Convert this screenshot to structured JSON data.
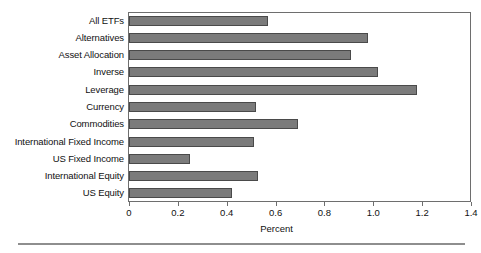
{
  "chart_data": {
    "type": "bar",
    "orientation": "horizontal",
    "title": "",
    "xlabel": "Percent",
    "ylabel": "",
    "xlim": [
      0,
      1.4
    ],
    "xticks": [
      "0",
      "0.2",
      "0.4",
      "0.6",
      "0.8",
      "1.0",
      "1.2",
      "1.4"
    ],
    "xtick_values": [
      0,
      0.2,
      0.4,
      0.6,
      0.8,
      1.0,
      1.2,
      1.4
    ],
    "grid": false,
    "legend": null,
    "categories": [
      "All ETFs",
      "Alternatives",
      "Asset Allocation",
      "Inverse",
      "Leverage",
      "Currency",
      "Commodities",
      "International Fixed Income",
      "US Fixed Income",
      "International Equity",
      "US Equity"
    ],
    "values": [
      0.57,
      0.98,
      0.91,
      1.02,
      1.18,
      0.52,
      0.69,
      0.51,
      0.25,
      0.53,
      0.42
    ],
    "bar_color": "#7b7b7b",
    "bar_edge_color": "#4a4a4a",
    "axis_color": "#6e6e6e"
  }
}
